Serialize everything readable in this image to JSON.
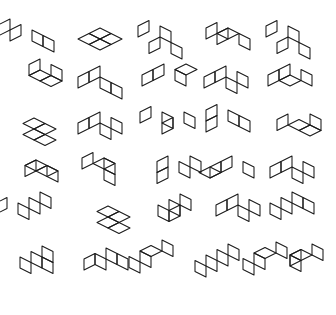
{
  "page": {
    "background_color": "#ffffff",
    "stroke_color": "#1a1a1a",
    "stroke_width": 1.05,
    "width": 336,
    "height": 315
  },
  "grid": {
    "rows": 6,
    "columns": 6,
    "unit": 11.0,
    "face_kinds": [
      "top",
      "left",
      "right"
    ],
    "face_kind_labels": {
      "top": "top-face-rhombus",
      "left": "left-face-rhombus",
      "right": "right-face-rhombus"
    }
  },
  "figures": [
    {
      "id": "r1c1",
      "row": 1,
      "col": 1,
      "name": "figure-r1c1",
      "ox": 32,
      "oy": 30,
      "faces": [
        [
          "left",
          -2,
          0
        ],
        [
          "left",
          -1,
          0
        ],
        [
          "right",
          0,
          0
        ],
        [
          "right",
          1,
          0
        ]
      ]
    },
    {
      "id": "r1c2",
      "row": 1,
      "col": 2,
      "name": "figure-r1c2",
      "ox": 100,
      "oy": 28,
      "faces": [
        [
          "top",
          0,
          0
        ],
        [
          "top",
          1,
          0
        ],
        [
          "top",
          0,
          1
        ],
        [
          "top",
          1,
          1
        ]
      ]
    },
    {
      "id": "r1c3",
      "row": 1,
      "col": 3,
      "name": "figure-r1c3",
      "ox": 160,
      "oy": 26,
      "faces": [
        [
          "left",
          -1,
          0
        ],
        [
          "right",
          0,
          0
        ],
        [
          "left",
          1,
          1
        ],
        [
          "right",
          2,
          1
        ]
      ]
    },
    {
      "id": "r1c4",
      "row": 1,
      "col": 4,
      "name": "figure-r1c4",
      "ox": 228,
      "oy": 28,
      "faces": [
        [
          "left",
          -1,
          0
        ],
        [
          "left",
          0,
          0
        ],
        [
          "top",
          0,
          0
        ],
        [
          "right",
          1,
          0
        ]
      ]
    },
    {
      "id": "r1c5",
      "row": 1,
      "col": 5,
      "name": "figure-r1c5",
      "ox": 288,
      "oy": 26,
      "faces": [
        [
          "left",
          -1,
          0
        ],
        [
          "right",
          0,
          0
        ],
        [
          "left",
          1,
          1
        ],
        [
          "right",
          2,
          1
        ]
      ]
    },
    {
      "id": "r2c1",
      "row": 2,
      "col": 1,
      "name": "figure-r2c1",
      "ox": 40,
      "oy": 70,
      "faces": [
        [
          "left",
          -1,
          -1
        ],
        [
          "right",
          0,
          -1
        ],
        [
          "top",
          0,
          0
        ],
        [
          "top",
          1,
          0
        ]
      ]
    },
    {
      "id": "r2c2",
      "row": 2,
      "col": 2,
      "name": "figure-r2c2",
      "ox": 100,
      "oy": 66,
      "faces": [
        [
          "left",
          0,
          0
        ],
        [
          "left",
          0,
          1
        ],
        [
          "right",
          1,
          1
        ],
        [
          "right",
          2,
          1
        ]
      ]
    },
    {
      "id": "r2c3",
      "row": 2,
      "col": 3,
      "name": "figure-r2c3",
      "ox": 164,
      "oy": 64,
      "faces": [
        [
          "left",
          0,
          0
        ],
        [
          "left",
          0,
          1
        ],
        [
          "right",
          1,
          0
        ],
        [
          "top",
          1,
          -1
        ]
      ]
    },
    {
      "id": "r2c4",
      "row": 2,
      "col": 4,
      "name": "figure-r2c4",
      "ox": 226,
      "oy": 66,
      "faces": [
        [
          "left",
          0,
          0
        ],
        [
          "left",
          0,
          1
        ],
        [
          "right",
          1,
          0
        ],
        [
          "right",
          1,
          1
        ]
      ]
    },
    {
      "id": "r2c5",
      "row": 2,
      "col": 5,
      "name": "figure-r2c5",
      "ox": 290,
      "oy": 64,
      "faces": [
        [
          "left",
          0,
          0
        ],
        [
          "left",
          0,
          1
        ],
        [
          "right",
          1,
          0
        ],
        [
          "top",
          1,
          1
        ]
      ]
    },
    {
      "id": "r3c1",
      "row": 3,
      "col": 1,
      "name": "figure-r3c1",
      "ox": 34,
      "oy": 118,
      "faces": [
        [
          "top",
          0,
          0
        ],
        [
          "top",
          1,
          0
        ],
        [
          "top",
          1,
          1
        ],
        [
          "top",
          2,
          1
        ]
      ]
    },
    {
      "id": "r3c2",
      "row": 3,
      "col": 2,
      "name": "figure-r3c2",
      "ox": 100,
      "oy": 112,
      "faces": [
        [
          "left",
          0,
          0
        ],
        [
          "left",
          0,
          1
        ],
        [
          "right",
          1,
          0
        ],
        [
          "right",
          1,
          1
        ]
      ]
    },
    {
      "id": "r3c3",
      "row": 3,
      "col": 3,
      "name": "figure-r3c3",
      "ox": 162,
      "oy": 112,
      "faces": [
        [
          "left",
          -1,
          0
        ],
        [
          "right",
          0,
          0
        ],
        [
          "left",
          1,
          0
        ],
        [
          "right",
          1,
          -1
        ]
      ]
    },
    {
      "id": "r3c4",
      "row": 3,
      "col": 4,
      "name": "figure-r3c4",
      "ox": 228,
      "oy": 110,
      "faces": [
        [
          "left",
          -1,
          0
        ],
        [
          "right",
          0,
          0
        ],
        [
          "right",
          1,
          0
        ],
        [
          "left",
          0,
          1
        ]
      ]
    },
    {
      "id": "r3c5",
      "row": 3,
      "col": 5,
      "name": "figure-r3c5",
      "ox": 288,
      "oy": 114,
      "faces": [
        [
          "left",
          0,
          0
        ],
        [
          "top",
          1,
          0
        ],
        [
          "top",
          2,
          0
        ],
        [
          "right",
          1,
          -1
        ]
      ]
    },
    {
      "id": "r4c1",
      "row": 4,
      "col": 1,
      "name": "figure-r4c1",
      "ox": 36,
      "oy": 160,
      "faces": [
        [
          "left",
          0,
          0
        ],
        [
          "top",
          0,
          0
        ],
        [
          "top",
          1,
          0
        ],
        [
          "right",
          1,
          0
        ]
      ]
    },
    {
      "id": "r4c2",
      "row": 4,
      "col": 2,
      "name": "figure-r4c2",
      "ox": 104,
      "oy": 158,
      "faces": [
        [
          "left",
          -1,
          0
        ],
        [
          "top",
          0,
          0
        ],
        [
          "right",
          0,
          0
        ],
        [
          "right",
          1,
          1
        ]
      ]
    },
    {
      "id": "r4c3",
      "row": 4,
      "col": 3,
      "name": "figure-r4c3",
      "ox": 168,
      "oy": 156,
      "faces": [
        [
          "left",
          0,
          0
        ],
        [
          "right",
          1,
          0
        ],
        [
          "left",
          1,
          1
        ],
        [
          "right",
          1,
          -1
        ]
      ]
    },
    {
      "id": "r4c4",
      "row": 4,
      "col": 4,
      "name": "figure-r4c4",
      "ox": 232,
      "oy": 156,
      "faces": [
        [
          "left",
          0,
          0
        ],
        [
          "right",
          1,
          0
        ],
        [
          "left",
          0,
          1
        ],
        [
          "top",
          0,
          2
        ]
      ]
    },
    {
      "id": "r4c5",
      "row": 4,
      "col": 5,
      "name": "figure-r4c5",
      "ox": 292,
      "oy": 156,
      "faces": [
        [
          "left",
          0,
          0
        ],
        [
          "right",
          1,
          0
        ],
        [
          "left",
          0,
          1
        ],
        [
          "right",
          1,
          1
        ]
      ]
    },
    {
      "id": "r5c1",
      "row": 5,
      "col": 1,
      "name": "figure-r5c1",
      "ox": 40,
      "oy": 192,
      "faces": [
        [
          "right",
          0,
          0
        ],
        [
          "right",
          0,
          1
        ],
        [
          "right",
          0,
          2
        ],
        [
          "left",
          -1,
          2
        ]
      ]
    },
    {
      "id": "r5c2",
      "row": 5,
      "col": 2,
      "name": "figure-r5c2",
      "ox": 108,
      "oy": 206,
      "faces": [
        [
          "top",
          0,
          0
        ],
        [
          "top",
          1,
          0
        ],
        [
          "top",
          1,
          1
        ],
        [
          "top",
          2,
          1
        ]
      ]
    },
    {
      "id": "r5c3",
      "row": 5,
      "col": 3,
      "name": "figure-r5c3",
      "ox": 180,
      "oy": 194,
      "faces": [
        [
          "right",
          0,
          0
        ],
        [
          "right",
          0,
          1
        ],
        [
          "right",
          0,
          2
        ],
        [
          "left",
          1,
          1
        ]
      ]
    },
    {
      "id": "r5c4",
      "row": 5,
      "col": 4,
      "name": "figure-r5c4",
      "ox": 238,
      "oy": 194,
      "faces": [
        [
          "left",
          0,
          0
        ],
        [
          "left",
          0,
          1
        ],
        [
          "right",
          1,
          0
        ],
        [
          "right",
          1,
          1
        ]
      ]
    },
    {
      "id": "r5c5",
      "row": 5,
      "col": 5,
      "name": "figure-r5c5",
      "ox": 292,
      "oy": 192,
      "faces": [
        [
          "right",
          0,
          0
        ],
        [
          "right",
          0,
          1
        ],
        [
          "right",
          1,
          0
        ],
        [
          "right",
          0,
          2
        ]
      ]
    },
    {
      "id": "r6c1",
      "row": 6,
      "col": 1,
      "name": "figure-r6c1",
      "ox": 42,
      "oy": 246,
      "faces": [
        [
          "right",
          0,
          0
        ],
        [
          "right",
          0,
          1
        ],
        [
          "right",
          0,
          2
        ],
        [
          "right",
          1,
          1
        ]
      ]
    },
    {
      "id": "r6c2",
      "row": 6,
      "col": 2,
      "name": "figure-r6c2",
      "ox": 106,
      "oy": 248,
      "faces": [
        [
          "right",
          0,
          0
        ],
        [
          "right",
          1,
          0
        ],
        [
          "right",
          0,
          1
        ],
        [
          "left",
          0,
          1
        ]
      ]
    },
    {
      "id": "r6c3",
      "row": 6,
      "col": 3,
      "name": "figure-r6c3",
      "ox": 162,
      "oy": 240,
      "faces": [
        [
          "right",
          0,
          0
        ],
        [
          "top",
          0,
          1
        ],
        [
          "right",
          0,
          2
        ],
        [
          "right",
          0,
          3
        ]
      ]
    },
    {
      "id": "r6c4",
      "row": 6,
      "col": 4,
      "name": "figure-r6c4",
      "ox": 228,
      "oy": 244,
      "faces": [
        [
          "right",
          0,
          0
        ],
        [
          "right",
          0,
          1
        ],
        [
          "right",
          0,
          2
        ],
        [
          "right",
          0,
          3
        ]
      ]
    },
    {
      "id": "r6c5",
      "row": 6,
      "col": 5,
      "name": "figure-r6c5",
      "ox": 276,
      "oy": 242,
      "faces": [
        [
          "right",
          0,
          0
        ],
        [
          "top",
          0,
          1
        ],
        [
          "right",
          0,
          2
        ],
        [
          "right",
          0,
          3
        ]
      ]
    },
    {
      "id": "r6c6",
      "row": 6,
      "col": 6,
      "name": "figure-r6c6",
      "ox": 312,
      "oy": 244,
      "faces": [
        [
          "right",
          0,
          0
        ],
        [
          "top",
          0,
          1
        ],
        [
          "left",
          0,
          1
        ],
        [
          "right",
          0,
          2
        ]
      ]
    }
  ]
}
